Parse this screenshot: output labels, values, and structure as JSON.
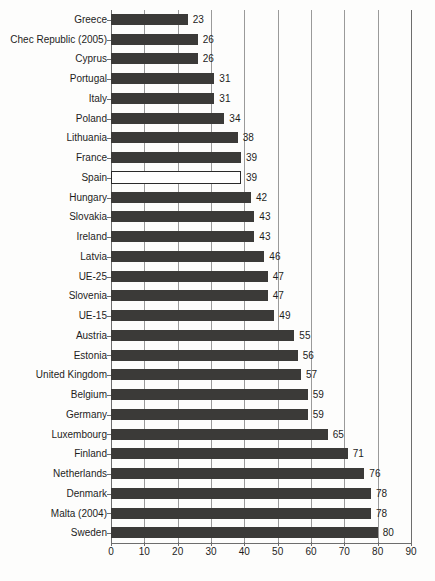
{
  "chart_data": {
    "type": "bar",
    "orientation": "horizontal",
    "title": "",
    "subtitle": "",
    "xlabel": "",
    "ylabel": "",
    "xlim": [
      0,
      90
    ],
    "xticks": [
      0,
      10,
      20,
      30,
      40,
      50,
      60,
      70,
      80,
      90
    ],
    "grid": "vertical",
    "legend": "none",
    "highlight_category": "Spain",
    "bar_color": "#3b3a38",
    "highlight_bar_color": "#ffffff",
    "highlight_bar_outline": "#2a2a2a",
    "axis_color": "#6d6d6d",
    "gridline_color": "#9a9a9a",
    "categories": [
      "Greece",
      "Chec Republic (2005)",
      "Cyprus",
      "Portugal",
      "Italy",
      "Poland",
      "Lithuania",
      "France",
      "Spain",
      "Hungary",
      "Slovakia",
      "Ireland",
      "Latvia",
      "UE-25",
      "Slovenia",
      "UE-15",
      "Austria",
      "Estonia",
      "United Kingdom",
      "Belgium",
      "Germany",
      "Luxembourg",
      "Finland",
      "Netherlands",
      "Denmark",
      "Malta (2004)",
      "Sweden"
    ],
    "values": [
      23,
      26,
      26,
      31,
      31,
      34,
      38,
      39,
      39,
      42,
      43,
      43,
      46,
      47,
      47,
      49,
      55,
      56,
      57,
      59,
      59,
      65,
      71,
      76,
      78,
      78,
      80
    ],
    "value_labels": [
      "23",
      "26",
      "26",
      "31",
      "31",
      "34",
      "38",
      "39",
      "39",
      "42",
      "43",
      "43",
      "46",
      "47",
      "47",
      "49",
      "55",
      "56",
      "57",
      "59",
      "59",
      "65",
      "71",
      "76",
      "78",
      "78",
      "80"
    ],
    "xtick_labels": [
      "0",
      "10",
      "20",
      "30",
      "40",
      "50",
      "60",
      "70",
      "80",
      "90"
    ]
  }
}
